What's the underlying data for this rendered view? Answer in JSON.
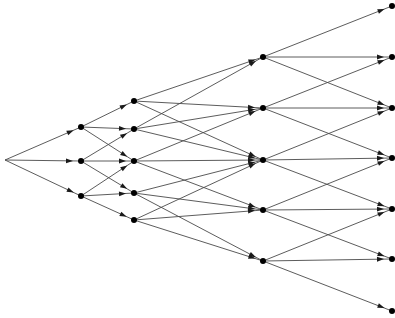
{
  "diagram": {
    "type": "trinomial-tree",
    "colors": {
      "edge": "#4a4a4a",
      "node": "#000000",
      "arrow": "#1a1a1a",
      "background": "#ffffff"
    },
    "levels": [
      {
        "level": 0,
        "x": 5,
        "nodes": [
          160
        ],
        "dot": false
      },
      {
        "level": 1,
        "x": 81,
        "nodes": [
          127,
          161,
          196
        ],
        "dot": true
      },
      {
        "level": 2,
        "x": 134,
        "nodes": [
          101,
          129,
          161,
          193,
          220
        ],
        "dot": true
      },
      {
        "level": 3,
        "x": 263,
        "nodes": [
          57,
          108,
          160,
          210,
          261
        ],
        "dot": true
      },
      {
        "level": 4,
        "x": 392,
        "nodes": [
          6,
          57,
          108,
          158,
          209,
          259,
          311
        ],
        "dot": true
      }
    ],
    "edges": [
      {
        "from": [
          0,
          0
        ],
        "to": [
          1,
          0
        ]
      },
      {
        "from": [
          0,
          0
        ],
        "to": [
          1,
          1
        ]
      },
      {
        "from": [
          0,
          0
        ],
        "to": [
          1,
          2
        ]
      },
      {
        "from": [
          1,
          0
        ],
        "to": [
          2,
          0
        ]
      },
      {
        "from": [
          1,
          0
        ],
        "to": [
          2,
          1
        ]
      },
      {
        "from": [
          1,
          0
        ],
        "to": [
          2,
          2
        ]
      },
      {
        "from": [
          1,
          1
        ],
        "to": [
          2,
          1
        ]
      },
      {
        "from": [
          1,
          1
        ],
        "to": [
          2,
          2
        ]
      },
      {
        "from": [
          1,
          1
        ],
        "to": [
          2,
          3
        ]
      },
      {
        "from": [
          1,
          2
        ],
        "to": [
          2,
          2
        ]
      },
      {
        "from": [
          1,
          2
        ],
        "to": [
          2,
          3
        ]
      },
      {
        "from": [
          1,
          2
        ],
        "to": [
          2,
          4
        ]
      },
      {
        "from": [
          2,
          0
        ],
        "to": [
          3,
          0
        ]
      },
      {
        "from": [
          2,
          0
        ],
        "to": [
          3,
          1
        ]
      },
      {
        "from": [
          2,
          0
        ],
        "to": [
          3,
          2
        ]
      },
      {
        "from": [
          2,
          1
        ],
        "to": [
          3,
          0
        ]
      },
      {
        "from": [
          2,
          1
        ],
        "to": [
          3,
          1
        ]
      },
      {
        "from": [
          2,
          1
        ],
        "to": [
          3,
          2
        ]
      },
      {
        "from": [
          2,
          2
        ],
        "to": [
          3,
          1
        ]
      },
      {
        "from": [
          2,
          2
        ],
        "to": [
          3,
          2
        ]
      },
      {
        "from": [
          2,
          2
        ],
        "to": [
          3,
          3
        ]
      },
      {
        "from": [
          2,
          3
        ],
        "to": [
          3,
          2
        ]
      },
      {
        "from": [
          2,
          3
        ],
        "to": [
          3,
          3
        ]
      },
      {
        "from": [
          2,
          3
        ],
        "to": [
          3,
          4
        ]
      },
      {
        "from": [
          2,
          4
        ],
        "to": [
          3,
          2
        ]
      },
      {
        "from": [
          2,
          4
        ],
        "to": [
          3,
          3
        ]
      },
      {
        "from": [
          2,
          4
        ],
        "to": [
          3,
          4
        ]
      },
      {
        "from": [
          3,
          0
        ],
        "to": [
          4,
          0
        ]
      },
      {
        "from": [
          3,
          0
        ],
        "to": [
          4,
          1
        ]
      },
      {
        "from": [
          3,
          0
        ],
        "to": [
          4,
          2
        ]
      },
      {
        "from": [
          3,
          1
        ],
        "to": [
          4,
          1
        ]
      },
      {
        "from": [
          3,
          1
        ],
        "to": [
          4,
          2
        ]
      },
      {
        "from": [
          3,
          1
        ],
        "to": [
          4,
          3
        ]
      },
      {
        "from": [
          3,
          2
        ],
        "to": [
          4,
          2
        ]
      },
      {
        "from": [
          3,
          2
        ],
        "to": [
          4,
          3
        ]
      },
      {
        "from": [
          3,
          2
        ],
        "to": [
          4,
          4
        ]
      },
      {
        "from": [
          3,
          3
        ],
        "to": [
          4,
          3
        ]
      },
      {
        "from": [
          3,
          3
        ],
        "to": [
          4,
          4
        ]
      },
      {
        "from": [
          3,
          3
        ],
        "to": [
          4,
          5
        ]
      },
      {
        "from": [
          3,
          4
        ],
        "to": [
          4,
          4
        ]
      },
      {
        "from": [
          3,
          4
        ],
        "to": [
          4,
          5
        ]
      },
      {
        "from": [
          3,
          4
        ],
        "to": [
          4,
          6
        ]
      }
    ]
  }
}
